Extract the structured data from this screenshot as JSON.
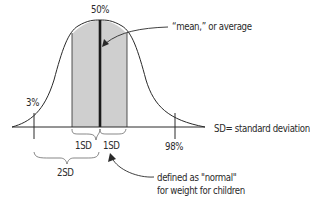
{
  "diagram": {
    "type": "normal-distribution",
    "labels": {
      "peak_percentile": "50%",
      "mean_annotation": "“mean,” or average",
      "low_percentile": "3%",
      "high_percentile": "98%",
      "sd_left": "1SD",
      "sd_right": "1SD",
      "two_sd": "2SD",
      "sd_legend": "SD= standard deviation",
      "normal_line1": "defined as \"normal\"",
      "normal_line2": "for weight for children"
    },
    "colors": {
      "line": "#2a2a2a",
      "shade": "#cfcfcf",
      "mean_line": "#1a1a1a",
      "background": "#ffffff"
    }
  }
}
